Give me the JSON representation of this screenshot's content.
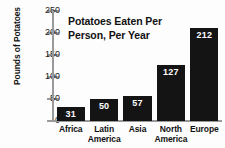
{
  "chart_data": {
    "type": "bar",
    "title": "Potatoes Eaten Per Person, Per Year",
    "title_line1": "Potatoes Eaten Per",
    "title_line2": "Person, Per Year",
    "xlabel": "",
    "ylabel": "Pounds of Potatoes",
    "ylim": [
      0,
      250
    ],
    "yticks": [
      0,
      50,
      100,
      150,
      200,
      250
    ],
    "ytick_labels": [
      "0",
      "50",
      "100",
      "150",
      "200",
      "250"
    ],
    "grid": false,
    "legend": false,
    "bar_color": "#141414",
    "value_label_color": "#ffffff",
    "axis_color": "#9a9a9a",
    "categories": [
      "Africa",
      "Latin America",
      "Asia",
      "North America",
      "Europe"
    ],
    "category_lines": [
      [
        "Africa"
      ],
      [
        "Latin",
        "America"
      ],
      [
        "Asia"
      ],
      [
        "North",
        "America"
      ],
      [
        "Europe"
      ]
    ],
    "values": [
      31,
      50,
      57,
      127,
      212
    ],
    "value_labels": [
      "31",
      "50",
      "57",
      "127",
      "212"
    ]
  }
}
